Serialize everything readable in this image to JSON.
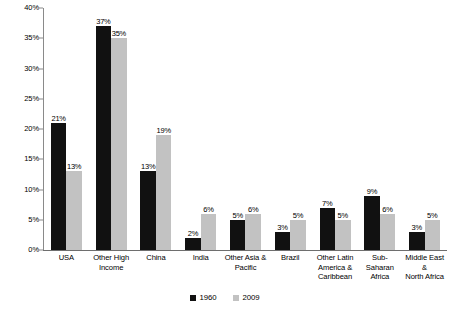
{
  "chart_data": {
    "type": "bar",
    "title": "",
    "xlabel": "",
    "ylabel": "",
    "ylim": [
      0,
      40
    ],
    "ytick_labels": [
      "0%",
      "5%",
      "10%",
      "15%",
      "20%",
      "25%",
      "30%",
      "35%",
      "40%"
    ],
    "ytick_values": [
      0,
      5,
      10,
      15,
      20,
      25,
      30,
      35,
      40
    ],
    "grid": false,
    "legend_position": "bottom-center",
    "categories": [
      "USA",
      "Other High\nIncome",
      "China",
      "India",
      "Other Asia &\nPacific",
      "Brazil",
      "Other Latin\nAmerica &\nCaribbean",
      "Sub-\nSaharan\nAfrica",
      "Middle East\n&\nNorth Africa"
    ],
    "series": [
      {
        "name": "1960",
        "color": "#111111",
        "values": [
          21,
          37,
          13,
          2,
          5,
          3,
          7,
          9,
          3
        ],
        "data_labels": [
          "21%",
          "37%",
          "13%",
          "2%",
          "5%",
          "3%",
          "7%",
          "9%",
          "3%"
        ]
      },
      {
        "name": "2009",
        "color": "#c2c2c2",
        "values": [
          13,
          35,
          19,
          6,
          6,
          5,
          5,
          6,
          5
        ],
        "data_labels": [
          "13%",
          "35%",
          "19%",
          "6%",
          "6%",
          "5%",
          "5%",
          "6%",
          "5%"
        ]
      }
    ]
  }
}
